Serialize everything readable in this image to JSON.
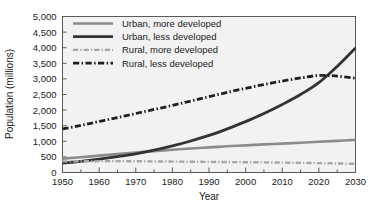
{
  "chart_data": {
    "type": "line",
    "title": "",
    "xlabel": "Year",
    "ylabel": "Population (millions)",
    "xlim": [
      1950,
      2030
    ],
    "ylim": [
      0,
      5000
    ],
    "xticks": [
      1950,
      1960,
      1970,
      1980,
      1990,
      2000,
      2010,
      2020,
      2030
    ],
    "xtick_labels": [
      "1950",
      "1960",
      "1970",
      "1980",
      "1990",
      "2000",
      "2010",
      "2020",
      "2030"
    ],
    "xminor_step": 5,
    "yticks": [
      0,
      500,
      1000,
      1500,
      2000,
      2500,
      3000,
      3500,
      4000,
      4500,
      5000
    ],
    "ytick_labels": [
      "0",
      "500",
      "1,000",
      "1,500",
      "2,000",
      "2,500",
      "3,000",
      "3,500",
      "4,000",
      "4,500",
      "5,000"
    ],
    "grid": false,
    "legend_position": "top-left-inside",
    "plot_background": "#f2f2f2",
    "x": [
      1950,
      1955,
      1960,
      1965,
      1970,
      1975,
      1980,
      1985,
      1990,
      1995,
      2000,
      2005,
      2010,
      2015,
      2020,
      2025,
      2030
    ],
    "series": [
      {
        "name": "Urban, more developed",
        "color": "#8c8c8c",
        "style": "solid",
        "width": 2.6,
        "values": [
          445,
          490,
          540,
          590,
          640,
          685,
          730,
          770,
          805,
          840,
          870,
          900,
          925,
          955,
          985,
          1015,
          1045
        ]
      },
      {
        "name": "Urban, less developed",
        "color": "#333333",
        "style": "solid",
        "width": 2.8,
        "values": [
          300,
          360,
          430,
          510,
          600,
          715,
          850,
          1010,
          1190,
          1400,
          1630,
          1890,
          2180,
          2500,
          2880,
          3400,
          3990
        ]
      },
      {
        "name": "Rural, more developed",
        "color": "#a6a6a6",
        "style": "dash-dot",
        "width": 2.4,
        "values": [
          355,
          360,
          363,
          363,
          360,
          355,
          350,
          345,
          340,
          335,
          330,
          325,
          318,
          310,
          300,
          290,
          278
        ]
      },
      {
        "name": "Rural, less developed",
        "color": "#1f1f1f",
        "style": "dash-dot",
        "width": 2.8,
        "values": [
          1395,
          1510,
          1635,
          1760,
          1890,
          2020,
          2150,
          2290,
          2430,
          2570,
          2700,
          2820,
          2930,
          3030,
          3110,
          3090,
          3020
        ]
      }
    ]
  },
  "legend": {
    "items": [
      {
        "label": "Urban, more developed"
      },
      {
        "label": "Urban, less developed"
      },
      {
        "label": "Rural, more developed"
      },
      {
        "label": "Rural, less developed"
      }
    ]
  }
}
